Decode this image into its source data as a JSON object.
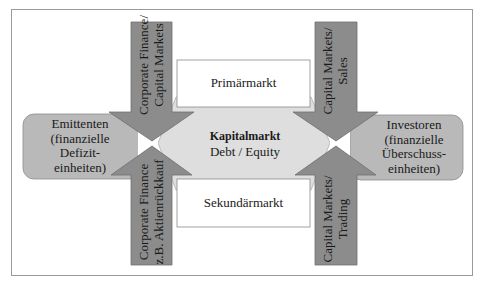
{
  "diagram": {
    "colors": {
      "frame_border": "#9a9a9a",
      "arrow_fill": "#8c8c8c",
      "arrow_stroke": "#6e6e6e",
      "side_box_fill": "#b9b9b9",
      "center_fill": "#dedede",
      "market_box_fill": "#ffffff",
      "text": "#1a1a1a"
    },
    "center": {
      "title": "Kapitalmarkt",
      "subtitle": "Debt / Equity"
    },
    "markets": {
      "primary": "Primärmarkt",
      "secondary": "Sekundärmarkt"
    },
    "left_box": {
      "lines": [
        "Emittenten",
        "(finanzielle",
        "Defizit-",
        "einheiten)"
      ]
    },
    "right_box": {
      "lines": [
        "Investoren",
        "(finanzielle",
        "Überschuss-",
        "einheiten)"
      ]
    },
    "arrows": {
      "top_left": {
        "direction": "down",
        "lines": [
          "Corporate Finance/",
          "Capital Markets"
        ]
      },
      "bottom_left": {
        "direction": "up",
        "lines": [
          "Corporate Finance",
          "z.B. Aktienrückkauf"
        ]
      },
      "top_right": {
        "direction": "down",
        "lines": [
          "Capital Markets/",
          "Sales"
        ]
      },
      "bottom_right": {
        "direction": "up",
        "lines": [
          "Capital Markets/",
          "Trading"
        ]
      }
    }
  }
}
